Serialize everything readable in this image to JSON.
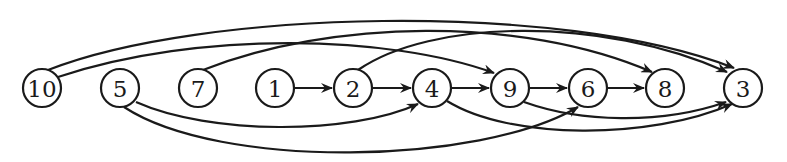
{
  "diagram": {
    "type": "directed-graph",
    "colors": {
      "stroke": "#1a1a1a",
      "background": "#ffffff"
    },
    "nodes": [
      {
        "id": "10",
        "label": "10",
        "x": 42,
        "y": 88
      },
      {
        "id": "5",
        "label": "5",
        "x": 120,
        "y": 88
      },
      {
        "id": "7",
        "label": "7",
        "x": 198,
        "y": 88
      },
      {
        "id": "1",
        "label": "1",
        "x": 275,
        "y": 88
      },
      {
        "id": "2",
        "label": "2",
        "x": 353,
        "y": 88
      },
      {
        "id": "4",
        "label": "4",
        "x": 432,
        "y": 88
      },
      {
        "id": "9",
        "label": "9",
        "x": 510,
        "y": 88
      },
      {
        "id": "6",
        "label": "6",
        "x": 588,
        "y": 88
      },
      {
        "id": "8",
        "label": "8",
        "x": 665,
        "y": 88
      },
      {
        "id": "3",
        "label": "3",
        "x": 743,
        "y": 88
      }
    ],
    "edges": [
      {
        "from": "1",
        "to": "2",
        "path": "M294,88 L332,88"
      },
      {
        "from": "2",
        "to": "4",
        "path": "M372,88 L411,88"
      },
      {
        "from": "4",
        "to": "9",
        "path": "M451,88 L489,88"
      },
      {
        "from": "9",
        "to": "6",
        "path": "M529,88 L567,88"
      },
      {
        "from": "6",
        "to": "8",
        "path": "M607,88 L644,88"
      },
      {
        "from": "10",
        "to": "3",
        "path": "M48,70 C200,10 560,0 734,68"
      },
      {
        "from": "10",
        "to": "9",
        "path": "M58,77 C200,30 390,35 494,73"
      },
      {
        "from": "7",
        "to": "8",
        "path": "M203,70 C330,20 520,15 652,72"
      },
      {
        "from": "2",
        "to": "3",
        "path": "M358,70 C430,20 600,15 727,72"
      },
      {
        "from": "5",
        "to": "4",
        "path": "M136,102 C210,135 350,135 418,104"
      },
      {
        "from": "5",
        "to": "6",
        "path": "M124,107 C220,170 480,165 578,107"
      },
      {
        "from": "4",
        "to": "3",
        "path": "M447,101 C510,140 650,140 732,104"
      },
      {
        "from": "9",
        "to": "3",
        "path": "M524,102 C580,122 660,125 726,102"
      }
    ]
  }
}
